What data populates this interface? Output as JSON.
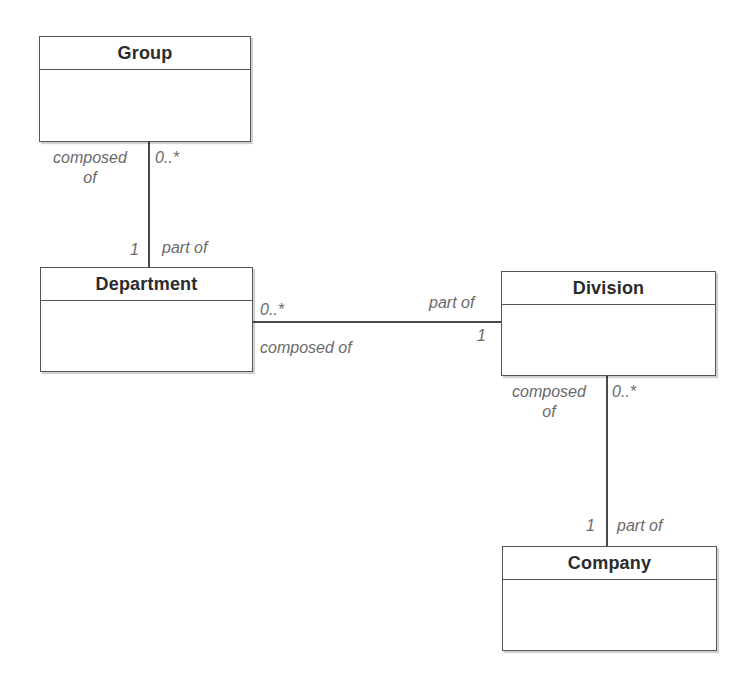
{
  "diagram": {
    "type": "UML class diagram",
    "classes": [
      {
        "id": "group",
        "name": "Group"
      },
      {
        "id": "department",
        "name": "Department"
      },
      {
        "id": "division",
        "name": "Division"
      },
      {
        "id": "company",
        "name": "Company"
      }
    ],
    "associations": [
      {
        "from": "Group",
        "to": "Department",
        "group_end": {
          "role": "composed of",
          "role_line1": "composed",
          "role_line2": "of",
          "multiplicity": "0..*"
        },
        "department_end": {
          "multiplicity": "1",
          "role": "part of"
        }
      },
      {
        "from": "Department",
        "to": "Division",
        "department_end": {
          "multiplicity": "0..*",
          "role": "composed of"
        },
        "division_end": {
          "role": "part of",
          "multiplicity": "1"
        }
      },
      {
        "from": "Division",
        "to": "Company",
        "division_end": {
          "role": "composed of",
          "role_line1": "composed",
          "role_line2": "of",
          "multiplicity": "0..*"
        },
        "company_end": {
          "multiplicity": "1",
          "role": "part of"
        }
      }
    ]
  }
}
